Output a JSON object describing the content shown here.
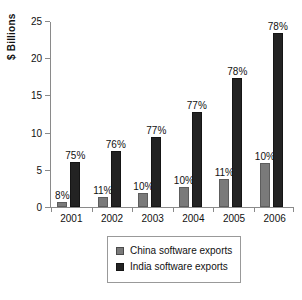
{
  "chart_data": {
    "type": "bar",
    "title": "",
    "xlabel": "",
    "ylabel": "$ Billions",
    "ylim": [
      0,
      25
    ],
    "yticks": [
      "0",
      "5",
      "10",
      "15",
      "20",
      "25"
    ],
    "grid": false,
    "legend_position": "bottom",
    "categories": [
      "2001",
      "2002",
      "2003",
      "2004",
      "2005",
      "2006"
    ],
    "series": [
      {
        "name": "China software exports",
        "color": "#7a7a7a",
        "values": [
          0.7,
          1.4,
          1.9,
          2.7,
          3.8,
          5.9
        ],
        "point_labels": [
          "8%",
          "11%",
          "10%",
          "10%",
          "11%",
          "10%"
        ]
      },
      {
        "name": "India software exports",
        "color": "#232323",
        "values": [
          6.1,
          7.6,
          9.5,
          12.9,
          17.5,
          23.5
        ],
        "point_labels": [
          "75%",
          "76%",
          "77%",
          "77%",
          "78%",
          "78%"
        ]
      }
    ]
  },
  "legend": {
    "items": [
      {
        "label": "China software exports"
      },
      {
        "label": "India software exports"
      }
    ]
  }
}
